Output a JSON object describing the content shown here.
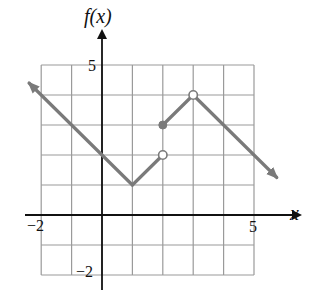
{
  "chart_data": {
    "type": "line",
    "title": "",
    "xlabel": "x",
    "ylabel": "f(x)",
    "xlim": [
      -2,
      5
    ],
    "ylim": [
      -2,
      5
    ],
    "grid": true,
    "tick_labels": {
      "x": [
        {
          "value": -2,
          "label": "−2"
        },
        {
          "value": 5,
          "label": "5"
        }
      ],
      "y": [
        {
          "value": 5,
          "label": "5"
        },
        {
          "value": -2,
          "label": "−2"
        }
      ]
    },
    "series": [
      {
        "name": "piece 1 (left branch, arrow to upper-left)",
        "points": [
          [
            -2.4,
            4.4
          ],
          [
            1,
            1
          ]
        ],
        "start_arrow": true
      },
      {
        "name": "piece 2",
        "points": [
          [
            1,
            1
          ],
          [
            2,
            2
          ]
        ],
        "end_marker": "open"
      },
      {
        "name": "piece 3",
        "points": [
          [
            2,
            3
          ],
          [
            3,
            4
          ]
        ],
        "start_marker": "closed",
        "end_marker": "open"
      },
      {
        "name": "piece 4 (right branch, arrow to lower-right)",
        "points": [
          [
            3,
            4
          ],
          [
            5.75,
            1.25
          ]
        ],
        "end_arrow": true
      }
    ],
    "markers": [
      {
        "x": 2,
        "y": 2,
        "type": "open"
      },
      {
        "x": 2,
        "y": 3,
        "type": "closed"
      },
      {
        "x": 3,
        "y": 4,
        "type": "open"
      }
    ],
    "colors": {
      "curve": "#7a7a7a",
      "grid": "#9a9a9a",
      "axis": "#111111"
    }
  },
  "labels": {
    "ylabel": "f(x)",
    "xlabel": "x",
    "y_tick_top": "5",
    "y_tick_bottom": "−2",
    "x_tick_left": "−2",
    "x_tick_right": "5"
  }
}
